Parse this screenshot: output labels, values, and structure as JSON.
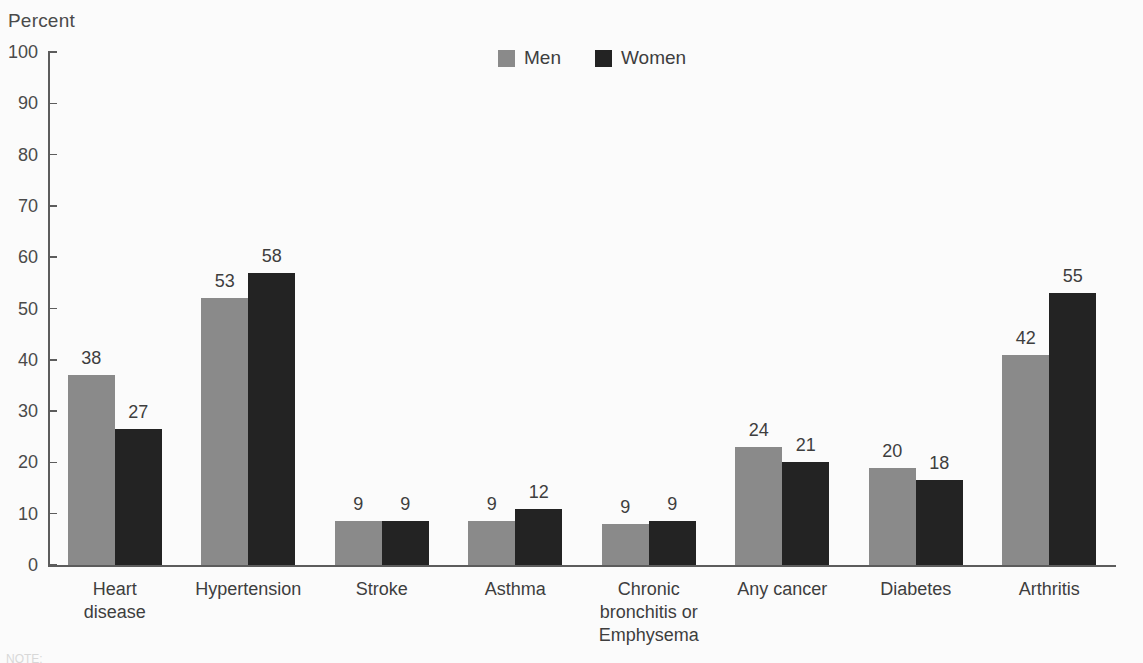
{
  "axis": {
    "y_title": "Percent",
    "y_ticks": [
      0,
      10,
      20,
      30,
      40,
      50,
      60,
      70,
      80,
      90,
      100
    ]
  },
  "legend": {
    "entries": [
      {
        "label": "Men",
        "color": "#8a8a8a",
        "swatch_name": "legend-swatch-men"
      },
      {
        "label": "Women",
        "color": "#232323",
        "swatch_name": "legend-swatch-women"
      }
    ]
  },
  "footer": {
    "note": "NOTE:"
  },
  "chart_data": {
    "type": "bar",
    "title": "",
    "xlabel": "",
    "ylabel": "Percent",
    "ylim": [
      0,
      100
    ],
    "grid": false,
    "legend_position": "top-center",
    "categories": [
      "Heart disease",
      "Hypertension",
      "Stroke",
      "Asthma",
      "Chronic bronchitis or Emphysema",
      "Any cancer",
      "Diabetes",
      "Arthritis"
    ],
    "category_lines": [
      [
        "Heart",
        "disease"
      ],
      [
        "Hypertension"
      ],
      [
        "Stroke"
      ],
      [
        "Asthma"
      ],
      [
        "Chronic",
        "bronchitis or",
        "Emphysema"
      ],
      [
        "Any cancer"
      ],
      [
        "Diabetes"
      ],
      [
        "Arthritis"
      ]
    ],
    "series": [
      {
        "name": "Men",
        "color": "#8a8a8a",
        "values": [
          38,
          53,
          9,
          9,
          9,
          24,
          20,
          42
        ],
        "drawn_heights": [
          37,
          52,
          8.5,
          8.5,
          8,
          23,
          19,
          41
        ]
      },
      {
        "name": "Women",
        "color": "#232323",
        "values": [
          27,
          58,
          9,
          12,
          9,
          21,
          18,
          55
        ],
        "drawn_heights": [
          26.5,
          57,
          8.5,
          11,
          8.5,
          20,
          16.5,
          53
        ]
      }
    ]
  }
}
